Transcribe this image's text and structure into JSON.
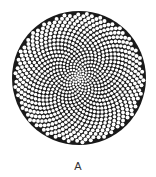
{
  "figure": {
    "label": "A",
    "pattern": "phyllotaxis-cell-array",
    "disk": {
      "cx": 79,
      "cy": 78,
      "r": 67,
      "fill": "#1a1a1a"
    },
    "cells": {
      "count": 900,
      "fill": "#ffffff",
      "center_size": 1.1,
      "edge_size": 2.0
    }
  }
}
